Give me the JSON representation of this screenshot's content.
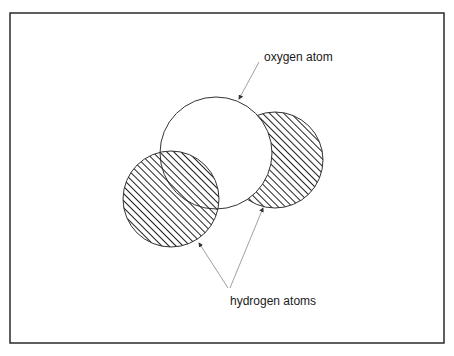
{
  "diagram": {
    "frame": {
      "x": 10,
      "y": 13,
      "width": 434,
      "height": 330,
      "stroke": "#2a2a2a"
    },
    "atoms": [
      {
        "id": "hydrogen-right",
        "type": "hydrogen",
        "cx": 275,
        "cy": 160,
        "r": 48,
        "fill": "hatched"
      },
      {
        "id": "oxygen",
        "type": "oxygen",
        "cx": 216,
        "cy": 153,
        "r": 56,
        "fill": "#ffffff"
      },
      {
        "id": "hydrogen-left",
        "type": "hydrogen",
        "cx": 171,
        "cy": 199,
        "r": 48,
        "fill": "hatched"
      }
    ],
    "labels": {
      "oxygen": "oxygen atom",
      "hydrogen": "hydrogen atoms"
    },
    "colors": {
      "stroke": "#333333",
      "hatch": "#222222",
      "arrow": "#888888"
    }
  }
}
